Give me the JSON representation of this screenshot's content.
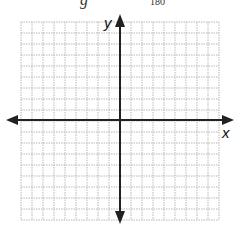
{
  "header_fragment": {
    "left_char": "g",
    "number": "180"
  },
  "graph": {
    "x_axis_label": "x",
    "y_axis_label": "y",
    "grid": {
      "columns": 18,
      "rows": 18,
      "line_style": "dotted",
      "line_color": "#b8b8b8"
    },
    "axis_color": "#222222"
  }
}
